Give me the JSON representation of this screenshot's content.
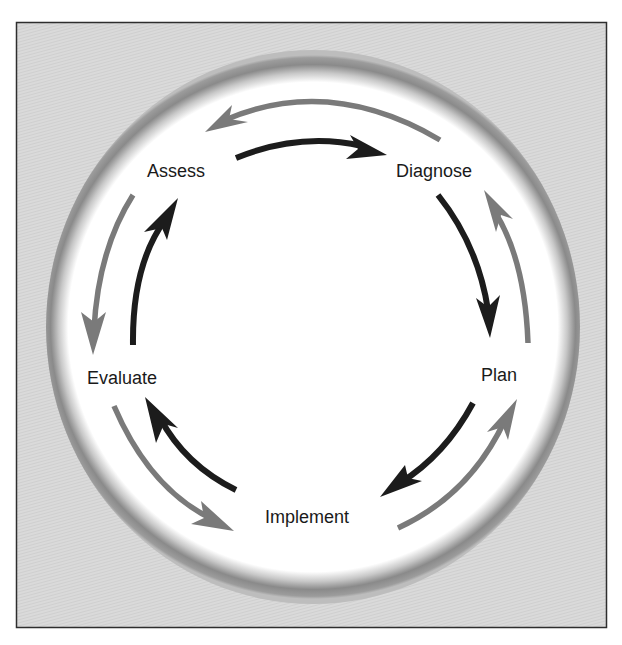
{
  "diagram": {
    "type": "cycle",
    "title": "",
    "frame": {
      "background": "#d9d9d9",
      "border": "#333333"
    },
    "ring": {
      "color": "#8c8c8c",
      "inner": "#ffffff"
    },
    "colors": {
      "forward_arrow": "#1c1c1c",
      "feedback_arrow": "#7a7a7a"
    },
    "nodes": [
      {
        "id": "assess",
        "label": "Assess"
      },
      {
        "id": "diagnose",
        "label": "Diagnose"
      },
      {
        "id": "plan",
        "label": "Plan"
      },
      {
        "id": "implement",
        "label": "Implement"
      },
      {
        "id": "evaluate",
        "label": "Evaluate"
      }
    ],
    "forward_edges": [
      {
        "from": "Assess",
        "to": "Diagnose"
      },
      {
        "from": "Diagnose",
        "to": "Plan"
      },
      {
        "from": "Plan",
        "to": "Implement"
      },
      {
        "from": "Implement",
        "to": "Evaluate"
      },
      {
        "from": "Evaluate",
        "to": "Assess"
      }
    ],
    "feedback_edges": [
      {
        "from": "Diagnose",
        "to": "Assess"
      },
      {
        "from": "Plan",
        "to": "Diagnose"
      },
      {
        "from": "Implement",
        "to": "Plan"
      },
      {
        "from": "Evaluate",
        "to": "Implement"
      },
      {
        "from": "Assess",
        "to": "Evaluate"
      }
    ]
  }
}
